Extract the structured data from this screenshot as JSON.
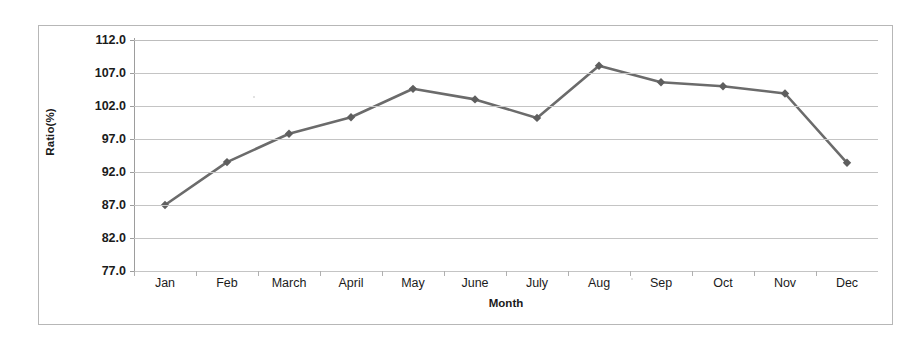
{
  "chart_data": {
    "type": "line",
    "title": "",
    "xlabel": "Month",
    "ylabel": "Ratio(%)",
    "categories": [
      "Jan",
      "Feb",
      "March",
      "April",
      "May",
      "June",
      "July",
      "Aug",
      "Sep",
      "Oct",
      "Nov",
      "Dec"
    ],
    "values": [
      87.0,
      93.5,
      97.8,
      100.3,
      104.6,
      103.0,
      100.2,
      108.1,
      105.6,
      105.0,
      103.9,
      93.4
    ],
    "series": [
      {
        "name": "Ratio(%)",
        "values": [
          87.0,
          93.5,
          97.8,
          100.3,
          104.6,
          103.0,
          100.2,
          108.1,
          105.6,
          105.0,
          103.9,
          93.4
        ]
      }
    ],
    "ylim": [
      77.0,
      112.0
    ],
    "ytick_labels": [
      "112.0",
      "107.0",
      "102.0",
      "97.0",
      "92.0",
      "87.0",
      "82.0",
      "77.0"
    ],
    "ytick_values": [
      112.0,
      107.0,
      102.0,
      97.0,
      92.0,
      87.0,
      82.0,
      77.0
    ],
    "grid": true,
    "legend": "none",
    "marker": "diamond",
    "line_color": "#6b6b6b",
    "marker_color": "#5e5e5e",
    "grid_color": "#c4c4c4",
    "axis_color": "#9d9d9d",
    "frame_color": "#b7b7b7",
    "text_color": "#1b1b1b"
  }
}
